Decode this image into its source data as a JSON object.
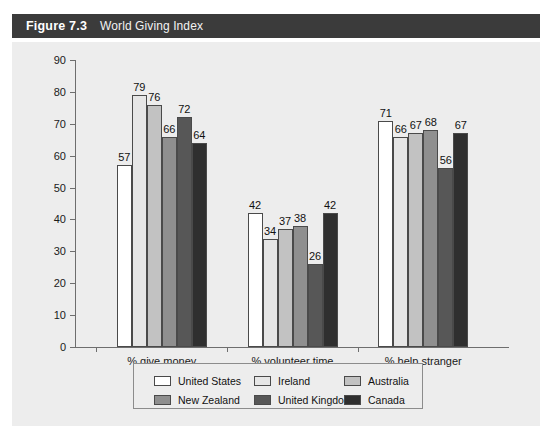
{
  "header": {
    "figure_number": "Figure 7.3",
    "title": "World Giving Index"
  },
  "chart_data": {
    "type": "bar",
    "title": "World Giving Index",
    "xlabel": "",
    "ylabel": "",
    "ylim": [
      0,
      90
    ],
    "ytick_step": 10,
    "yticks": [
      "0",
      "10",
      "20",
      "30",
      "40",
      "50",
      "60",
      "70",
      "80",
      "90"
    ],
    "grid": false,
    "legend_position": "bottom",
    "categories": [
      "% give money",
      "% volunteer time",
      "% help stranger"
    ],
    "series": [
      {
        "name": "United States",
        "color": "#ffffff",
        "values": [
          57,
          42,
          71
        ]
      },
      {
        "name": "Ireland",
        "color": "#e6e6e6",
        "values": [
          79,
          34,
          66
        ]
      },
      {
        "name": "Australia",
        "color": "#c2c2c2",
        "values": [
          76,
          37,
          67
        ]
      },
      {
        "name": "New Zealand",
        "color": "#8f8f8f",
        "values": [
          66,
          38,
          68
        ]
      },
      {
        "name": "United Kingdom",
        "color": "#575757",
        "values": [
          72,
          26,
          56
        ]
      },
      {
        "name": "Canada",
        "color": "#2f2f2f",
        "values": [
          64,
          42,
          67
        ]
      }
    ]
  },
  "colors": {
    "header_bar": "#3b3b3b",
    "panel": "#ededed",
    "axis": "#6e6e6e",
    "bar_outline": "#4a4a4a",
    "text": "#111111"
  }
}
